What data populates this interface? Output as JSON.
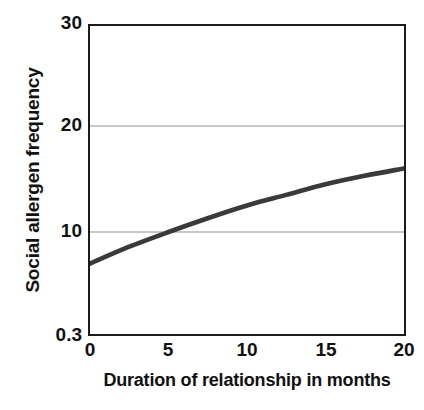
{
  "chart_data": {
    "type": "line",
    "title": "",
    "subtitle": "",
    "xlabel": "Duration of relationship in months",
    "ylabel": "Social allergen frequency",
    "x": [
      0,
      2.5,
      5,
      7.5,
      10,
      12.5,
      15,
      17.5,
      20
    ],
    "series": [
      {
        "name": "Social allergen frequency",
        "color": "#3a3a3a",
        "values": [
          7.0,
          8.6,
          10.0,
          11.3,
          12.5,
          13.5,
          14.5,
          15.3,
          16.0
        ]
      }
    ],
    "xlim": [
      0,
      20
    ],
    "ylim": [
      0.3,
      30
    ],
    "xticks": [
      0,
      5,
      10,
      15,
      20
    ],
    "xtick_labels": [
      "0",
      "5",
      "10",
      "15",
      "20"
    ],
    "yticks": [
      0.3,
      10,
      20,
      30
    ],
    "ytick_labels": [
      "0.3",
      "10",
      "20",
      "30"
    ],
    "gridlines": {
      "horizontal_at": [
        10,
        20
      ],
      "color": "#b4b4b4",
      "vertical": false
    },
    "legend": null,
    "annotations": [],
    "frame_color": "#1b1b1b",
    "background": "#ffffff"
  },
  "axes": {
    "y_title": "Social allergen frequency",
    "x_title": "Duration of relationship in months",
    "y_tick_labels": [
      "30",
      "20",
      "10",
      "0.3"
    ],
    "x_tick_labels": [
      "0",
      "5",
      "10",
      "15",
      "20"
    ]
  }
}
